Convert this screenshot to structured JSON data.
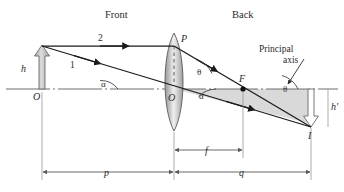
{
  "figure": {
    "type": "optics-ray-diagram"
  },
  "labels": {
    "front": "Front",
    "back": "Back",
    "principal_axis_line1": "Principal",
    "principal_axis_line2": "axis",
    "object_height": "h",
    "image_height": "h'",
    "ray_one": "1",
    "ray_two": "2",
    "point_object": "O",
    "point_lens_center": "O",
    "point_top_lens": "P",
    "point_focus": "F",
    "point_image": "I",
    "angle_alpha_left": "α",
    "angle_alpha_right": "α",
    "angle_theta_left": "θ",
    "angle_theta_right": "θ",
    "distance_object": "p",
    "distance_focal": "f",
    "distance_image": "q"
  },
  "colors": {
    "ink": "#2b2b2b",
    "ray": "#1a1a1a",
    "axis": "#6e6e6e",
    "lens_fill_edge": "#9a9a9a",
    "lens_fill_center": "#efefef",
    "lens_stroke": "#5a5a5a",
    "object_arrow_fill": "#c9c9c9",
    "object_arrow_stroke": "#6a6a6a",
    "image_arrow_fill": "#ffffff",
    "image_arrow_stroke": "#6a6a6a",
    "triangle_shade": "#d8d8d8",
    "dimension": "#5a5a5a",
    "background": "#ffffff"
  },
  "geometry": {
    "axis_y": 89,
    "object_x": 42,
    "object_top_y": 46,
    "lens_center_x": 174,
    "lens_top_y": 33,
    "lens_bottom_y": 131,
    "point_P_y": 46,
    "focus_x": 243,
    "image_x": 311,
    "image_bottom_y": 127
  }
}
